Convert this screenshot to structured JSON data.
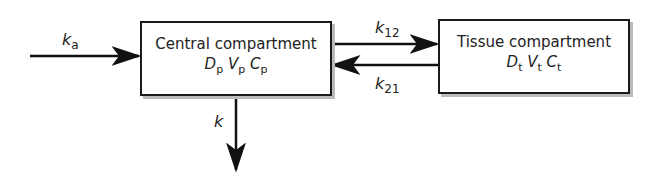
{
  "central": {
    "title": "Central compartment",
    "vars": [
      {
        "sym": "D",
        "sub": "p"
      },
      {
        "sym": "V",
        "sub": "p"
      },
      {
        "sym": "C",
        "sub": "p"
      }
    ]
  },
  "tissue": {
    "title": "Tissue compartment",
    "vars": [
      {
        "sym": "D",
        "sub": "t"
      },
      {
        "sym": "V",
        "sub": "t"
      },
      {
        "sym": "C",
        "sub": "t"
      }
    ]
  },
  "rates": {
    "ka": {
      "sym": "k",
      "sub": "a"
    },
    "k12": {
      "sym": "k",
      "sub": "12"
    },
    "k21": {
      "sym": "k",
      "sub": "21"
    },
    "k": {
      "sym": "k",
      "sub": ""
    }
  }
}
